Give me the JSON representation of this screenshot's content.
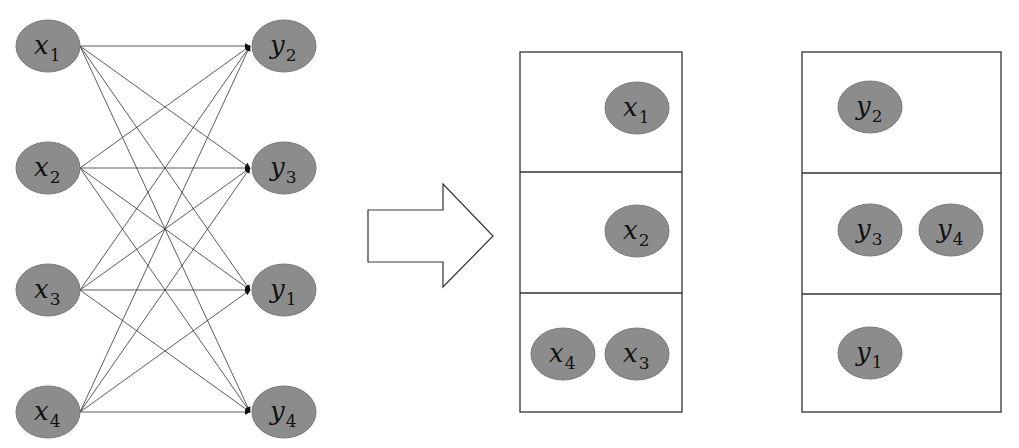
{
  "left_graph": {
    "sources": [
      {
        "id": "x1",
        "var": "x",
        "sub": "1",
        "cx": 48,
        "cy": 46
      },
      {
        "id": "x2",
        "var": "x",
        "sub": "2",
        "cx": 48,
        "cy": 168
      },
      {
        "id": "x3",
        "var": "x",
        "sub": "3",
        "cx": 48,
        "cy": 290
      },
      {
        "id": "x4",
        "var": "x",
        "sub": "4",
        "cx": 48,
        "cy": 412
      }
    ],
    "targets": [
      {
        "id": "y2",
        "var": "y",
        "sub": "2",
        "cx": 284,
        "cy": 46
      },
      {
        "id": "y3",
        "var": "y",
        "sub": "3",
        "cx": 284,
        "cy": 168
      },
      {
        "id": "y1",
        "var": "y",
        "sub": "1",
        "cx": 284,
        "cy": 290
      },
      {
        "id": "y4",
        "var": "y",
        "sub": "4",
        "cx": 284,
        "cy": 412
      }
    ],
    "edges": "complete-bipartite"
  },
  "arrow": {
    "direction": "right"
  },
  "partition_x": {
    "rows": [
      {
        "nodes": [
          {
            "var": "x",
            "sub": "1"
          }
        ]
      },
      {
        "nodes": [
          {
            "var": "x",
            "sub": "2"
          }
        ]
      },
      {
        "nodes": [
          {
            "var": "x",
            "sub": "4"
          },
          {
            "var": "x",
            "sub": "3"
          }
        ]
      }
    ]
  },
  "partition_y": {
    "rows": [
      {
        "nodes": [
          {
            "var": "y",
            "sub": "2"
          }
        ]
      },
      {
        "nodes": [
          {
            "var": "y",
            "sub": "3"
          },
          {
            "var": "y",
            "sub": "4"
          }
        ]
      },
      {
        "nodes": [
          {
            "var": "y",
            "sub": "1"
          }
        ]
      }
    ]
  },
  "colors": {
    "node_fill": "#8c8c8c",
    "line": "#333333"
  }
}
